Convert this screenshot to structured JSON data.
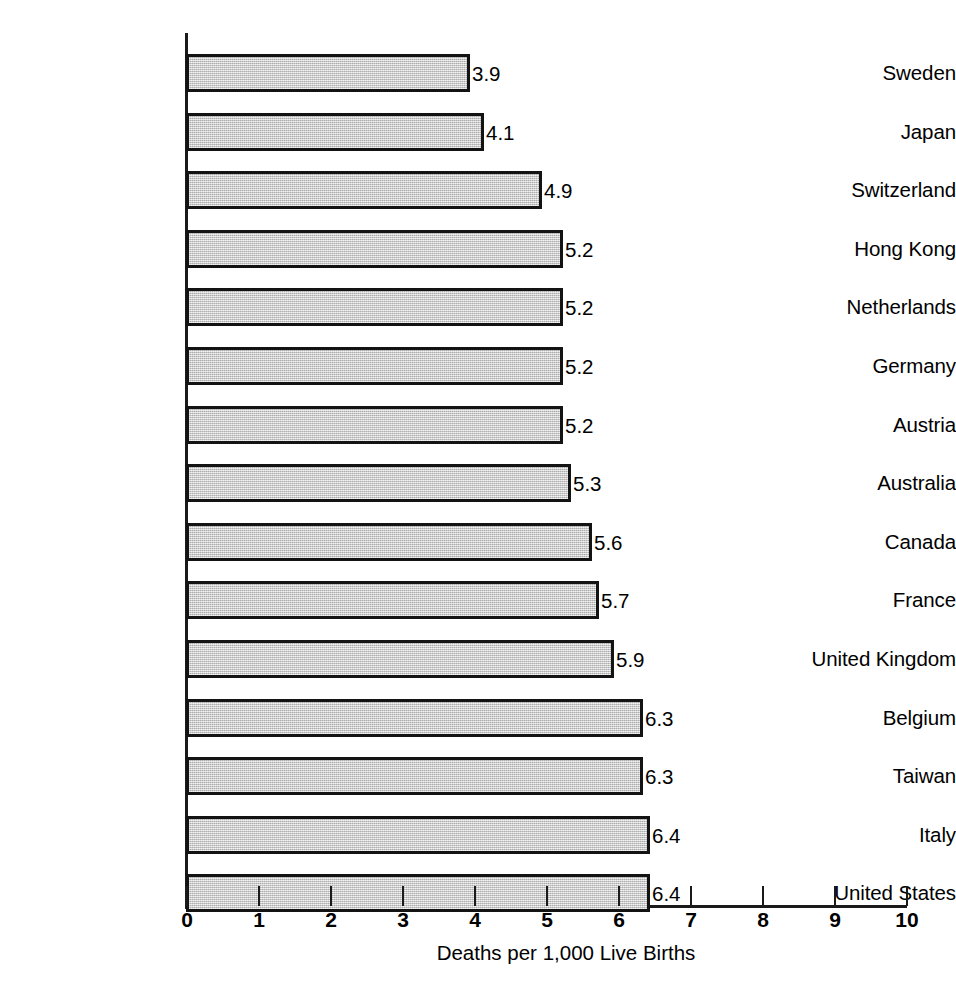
{
  "chart_data": {
    "type": "bar",
    "orientation": "horizontal",
    "title": "",
    "subtitle": "",
    "xlabel": "Deaths per 1,000 Live Births",
    "ylabel": "",
    "categories": [
      "Sweden",
      "Japan",
      "Switzerland",
      "Hong Kong",
      "Netherlands",
      "Germany",
      "Austria",
      "Australia",
      "Canada",
      "France",
      "United Kingdom",
      "Belgium",
      "Taiwan",
      "Italy",
      "United States"
    ],
    "values": [
      3.9,
      4.1,
      4.9,
      5.2,
      5.2,
      5.2,
      5.2,
      5.3,
      5.6,
      5.7,
      5.9,
      6.3,
      6.3,
      6.4,
      6.4
    ],
    "value_labels": [
      "3.9",
      "4.1",
      "4.9",
      "5.2",
      "5.2",
      "5.2",
      "5.2",
      "5.3",
      "5.6",
      "5.7",
      "5.9",
      "6.3",
      "6.3",
      "6.4",
      "6.4"
    ],
    "xlim": [
      0,
      10
    ],
    "xticks": [
      0,
      1,
      2,
      3,
      4,
      5,
      6,
      7,
      8,
      9,
      10
    ],
    "xtick_labels": [
      "0",
      "1",
      "2",
      "3",
      "4",
      "5",
      "6",
      "7",
      "8",
      "9",
      "10"
    ],
    "grid": false,
    "legend": null,
    "bar_fill_color": "#c9c9c9",
    "bar_border_color": "#131313",
    "axis_color": "#1a1a1a",
    "background_color": "#ffffff"
  }
}
